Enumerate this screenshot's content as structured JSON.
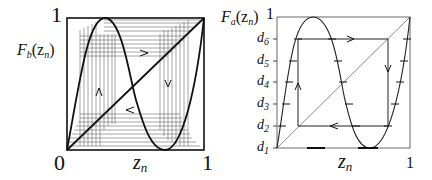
{
  "left_panel": {
    "y_label_main": "F",
    "y_label_sub": "b",
    "y_label_arg": "(z",
    "y_label_arg_sub": "n",
    "y_label_close": ")",
    "y_top_tick": "1",
    "x_origin_tick": "0",
    "x_right_tick": "1",
    "x_label_main": "z",
    "x_label_sub": "n",
    "arrows": [
      "up-arrow",
      "right-arrow",
      "down-arrow",
      "left-arrow"
    ]
  },
  "right_panel": {
    "y_label_main": "F",
    "y_label_sub": "a",
    "y_label_arg": "(z",
    "y_label_arg_sub": "n",
    "y_label_close": ")",
    "y_top_tick": "1",
    "x_right_tick": "1",
    "x_label_main": "z",
    "x_label_sub": "n",
    "y_ticks": [
      {
        "main": "d",
        "sub": "6"
      },
      {
        "main": "d",
        "sub": "5"
      },
      {
        "main": "d",
        "sub": "4"
      },
      {
        "main": "d",
        "sub": "3"
      },
      {
        "main": "d",
        "sub": "2"
      },
      {
        "main": "d",
        "sub": "1"
      }
    ],
    "arrows": [
      "up-arrow",
      "right-arrow",
      "down-arrow",
      "left-arrow"
    ]
  },
  "colors": {
    "line": "#111111",
    "thin_line": "#555555",
    "background": "#ffffff"
  }
}
